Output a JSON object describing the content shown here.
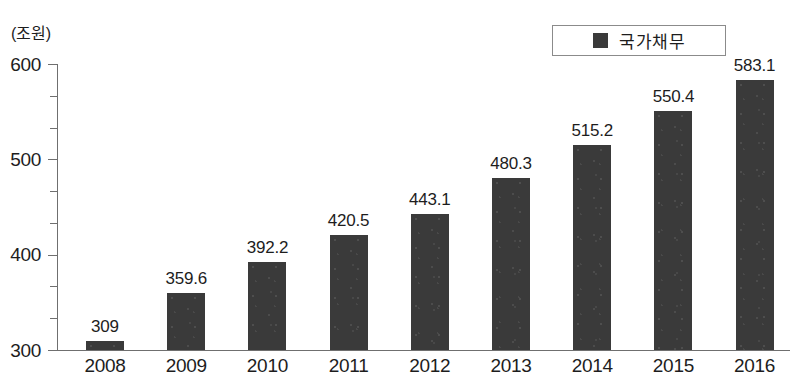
{
  "unit_label": "(조원)",
  "legend": {
    "series_label": "국가채무",
    "swatch_color": "#3a3a3a"
  },
  "axis": {
    "y_tick_labels": [
      "300",
      "400",
      "500",
      "600"
    ],
    "x_tick_labels": [
      "2008",
      "2009",
      "2010",
      "2011",
      "2012",
      "2013",
      "2014",
      "2015",
      "2016"
    ]
  },
  "value_labels": [
    "309",
    "359.6",
    "392.2",
    "420.5",
    "443.1",
    "480.3",
    "515.2",
    "550.4",
    "583.1"
  ],
  "chart_data": {
    "type": "bar",
    "title": "",
    "xlabel": "",
    "ylabel": "(조원)",
    "categories": [
      "2008",
      "2009",
      "2010",
      "2011",
      "2012",
      "2013",
      "2014",
      "2015",
      "2016"
    ],
    "series": [
      {
        "name": "국가채무",
        "color": "#3a3a3a",
        "values": [
          309,
          359.6,
          392.2,
          420.5,
          443.1,
          480.3,
          515.2,
          550.4,
          583.1
        ]
      }
    ],
    "ylim": [
      300,
      600
    ],
    "y_major_ticks": [
      300,
      400,
      500,
      600
    ],
    "y_minor_tick_step": 33.3,
    "grid": false,
    "legend_position": "top-right"
  }
}
